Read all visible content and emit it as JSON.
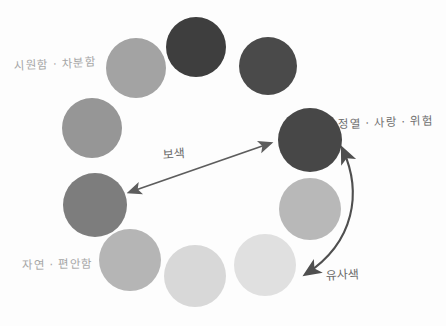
{
  "diagram": {
    "background_color": "#fdfdfd",
    "style": "hand-drawn grayscale color wheel"
  },
  "wheel": {
    "center_x": 205,
    "center_y": 163,
    "radius": 113,
    "swatches": [
      {
        "id": "swatch-1",
        "position": "top",
        "color": "#3e3e3e",
        "cx": 196,
        "cy": 47,
        "r": 30
      },
      {
        "id": "swatch-2",
        "position": "top-right",
        "color": "#4a4a4a",
        "cx": 268,
        "cy": 66,
        "r": 29
      },
      {
        "id": "swatch-3",
        "position": "right-upper",
        "color": "#474747",
        "cx": 310,
        "cy": 140,
        "r": 32
      },
      {
        "id": "swatch-4",
        "position": "right-lower",
        "color": "#b8b8b8",
        "cx": 310,
        "cy": 209,
        "r": 31
      },
      {
        "id": "swatch-5",
        "position": "bottom-right",
        "color": "#e0e0e0",
        "cx": 265,
        "cy": 265,
        "r": 31
      },
      {
        "id": "swatch-6",
        "position": "bottom",
        "color": "#d8d8d8",
        "cx": 195,
        "cy": 276,
        "r": 31
      },
      {
        "id": "swatch-7",
        "position": "bottom-left",
        "color": "#b5b5b5",
        "cx": 130,
        "cy": 260,
        "r": 31
      },
      {
        "id": "swatch-8",
        "position": "left-lower",
        "color": "#7d7d7d",
        "cx": 95,
        "cy": 205,
        "r": 32
      },
      {
        "id": "swatch-9",
        "position": "left-upper",
        "color": "#969696",
        "cx": 92,
        "cy": 128,
        "r": 30
      },
      {
        "id": "swatch-10",
        "position": "top-left",
        "color": "#a3a3a3",
        "cx": 136,
        "cy": 68,
        "r": 30
      }
    ]
  },
  "labels": {
    "cool_calm": "시원함 · 차분함",
    "passion_love_danger": "정열 · 사랑 · 위험",
    "nature_comfort": "자연 · 편안함"
  },
  "annotations": {
    "complementary": "보색",
    "analogous": "유사색"
  },
  "arrows": {
    "complementary_arrow": {
      "name": "complementary-arrow",
      "type": "double-headed-straight",
      "from_x": 128,
      "from_y": 193,
      "to_x": 272,
      "to_y": 143,
      "color": "#5d5d5d"
    },
    "analogous_arrow": {
      "name": "analogous-arrow",
      "type": "double-headed-curved",
      "from_x": 345,
      "from_y": 148,
      "to_x": 303,
      "to_y": 277,
      "color": "#4f4f4f"
    }
  },
  "colors": {
    "ink": "#5d5d5d",
    "label_text": "#8e8e8e",
    "annotation_text": "#6b6b6b",
    "paper": "#fdfdfd"
  }
}
